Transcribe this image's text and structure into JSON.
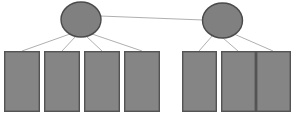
{
  "diagram": {
    "type": "node-link",
    "canvas": {
      "width": 299,
      "height": 119,
      "background": "#ffffff"
    },
    "style": {
      "node_fill": "#808080",
      "node_stroke": "#4a4a4a",
      "node_stroke_width": 1.4,
      "leaf_fill": "#858585",
      "leaf_stroke": "#545454",
      "leaf_stroke_width": 1.4,
      "edge_stroke": "#9a9a9a",
      "edge_stroke_width": 0.8
    },
    "nodes": [
      {
        "id": "node-left",
        "shape": "ellipse",
        "label": "",
        "cx": 81,
        "cy": 19.5,
        "rx": 20,
        "ry": 17.5
      },
      {
        "id": "node-right",
        "shape": "ellipse",
        "label": "",
        "cx": 222.5,
        "cy": 20.5,
        "rx": 20,
        "ry": 17.5
      }
    ],
    "leaves": [
      {
        "id": "leaf-l1",
        "group": "left",
        "label": "",
        "x": 4,
        "y": 51,
        "width": 36,
        "height": 61
      },
      {
        "id": "leaf-l2",
        "group": "left",
        "label": "",
        "x": 44,
        "y": 51,
        "width": 36,
        "height": 61
      },
      {
        "id": "leaf-l3",
        "group": "left",
        "label": "",
        "x": 84,
        "y": 51,
        "width": 36,
        "height": 61
      },
      {
        "id": "leaf-l4",
        "group": "left",
        "label": "",
        "x": 124,
        "y": 51,
        "width": 36,
        "height": 61
      },
      {
        "id": "leaf-r1",
        "group": "right",
        "label": "",
        "x": 182,
        "y": 51,
        "width": 35,
        "height": 61
      },
      {
        "id": "leaf-r2",
        "group": "right",
        "label": "",
        "x": 221,
        "y": 51,
        "width": 35,
        "height": 61
      },
      {
        "id": "leaf-r3",
        "group": "right",
        "label": "",
        "x": 256,
        "y": 51,
        "width": 35,
        "height": 61
      }
    ],
    "edges": [
      {
        "id": "edge-node-node",
        "kind": "sibling",
        "from": "node-left",
        "to": "node-right",
        "x1": 100,
        "y1": 16,
        "x2": 203,
        "y2": 20
      },
      {
        "id": "edge-l1",
        "kind": "parent-child",
        "from": "node-left",
        "to": "leaf-l1",
        "x1": 70,
        "y1": 34,
        "x2": 22,
        "y2": 51
      },
      {
        "id": "edge-l2",
        "kind": "parent-child",
        "from": "node-left",
        "to": "leaf-l2",
        "x1": 76,
        "y1": 36,
        "x2": 62,
        "y2": 51
      },
      {
        "id": "edge-l3",
        "kind": "parent-child",
        "from": "node-left",
        "to": "leaf-l3",
        "x1": 86,
        "y1": 36,
        "x2": 102,
        "y2": 51
      },
      {
        "id": "edge-l4",
        "kind": "parent-child",
        "from": "node-left",
        "to": "leaf-l4",
        "x1": 92,
        "y1": 34,
        "x2": 142,
        "y2": 51
      },
      {
        "id": "edge-r1",
        "kind": "parent-child",
        "from": "node-right",
        "to": "leaf-r1",
        "x1": 213,
        "y1": 35,
        "x2": 199,
        "y2": 51
      },
      {
        "id": "edge-r2",
        "kind": "parent-child",
        "from": "node-right",
        "to": "leaf-r2",
        "x1": 223,
        "y1": 38,
        "x2": 238,
        "y2": 51
      },
      {
        "id": "edge-r3",
        "kind": "parent-child",
        "from": "node-right",
        "to": "leaf-r3",
        "x1": 234,
        "y1": 34,
        "x2": 273,
        "y2": 51
      }
    ]
  }
}
